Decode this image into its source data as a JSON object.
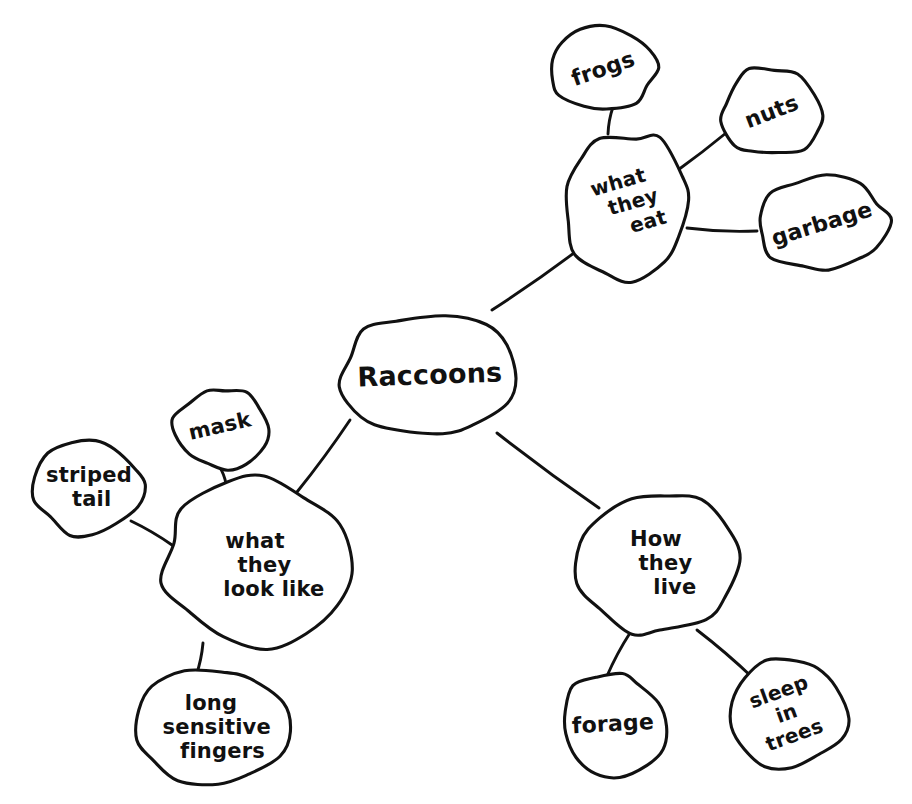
{
  "diagram": {
    "style": "hand-drawn pen on white paper",
    "ink_color": "#111111",
    "background_color": "#ffffff"
  },
  "nodes": [
    {
      "id": "raccoons",
      "label": "Raccoons",
      "lines": [
        "Raccoons"
      ],
      "role": "center",
      "cx": 430,
      "cy": 374,
      "rx": 92,
      "ry": 62,
      "font_size": 27,
      "rotate": -2,
      "text_dx": 0,
      "text_dy": 0,
      "seed": 3
    },
    {
      "id": "what-they-eat",
      "label": "what they eat",
      "lines": [
        "what",
        "they",
        "eat"
      ],
      "role": "branch",
      "cx": 625,
      "cy": 205,
      "rx": 64,
      "ry": 74,
      "font_size": 20,
      "rotate": -16,
      "text_dx": 0,
      "text_dy": 0,
      "seed": 7
    },
    {
      "id": "frogs",
      "label": "frogs",
      "lines": [
        "frogs"
      ],
      "role": "leaf",
      "cx": 603,
      "cy": 69,
      "rx": 53,
      "ry": 42,
      "font_size": 22,
      "rotate": -19,
      "text_dx": 0,
      "text_dy": 0,
      "seed": 11
    },
    {
      "id": "nuts",
      "label": "nuts",
      "lines": [
        "nuts"
      ],
      "role": "leaf",
      "cx": 772,
      "cy": 112,
      "rx": 51,
      "ry": 45,
      "font_size": 22,
      "rotate": -21,
      "text_dx": 0,
      "text_dy": 0,
      "seed": 13
    },
    {
      "id": "garbage",
      "label": "garbage",
      "lines": [
        "garbage"
      ],
      "role": "leaf",
      "cx": 822,
      "cy": 224,
      "rx": 66,
      "ry": 47,
      "font_size": 22,
      "rotate": -17,
      "text_dx": 0,
      "text_dy": 0,
      "seed": 17
    },
    {
      "id": "what-they-look-like",
      "label": "what they look like",
      "lines": [
        "what",
        "they",
        "look like"
      ],
      "role": "branch",
      "cx": 255,
      "cy": 565,
      "rx": 92,
      "ry": 84,
      "font_size": 21,
      "rotate": 0,
      "text_dx": 0,
      "text_dy": 0,
      "seed": 23
    },
    {
      "id": "mask",
      "label": "mask",
      "lines": [
        "mask"
      ],
      "role": "leaf",
      "cx": 220,
      "cy": 428,
      "rx": 46,
      "ry": 41,
      "font_size": 21,
      "rotate": -13,
      "text_dx": 0,
      "text_dy": -2,
      "seed": 29
    },
    {
      "id": "striped-tail",
      "label": "striped tail",
      "lines": [
        "striped",
        "tail"
      ],
      "role": "leaf",
      "cx": 89,
      "cy": 487,
      "rx": 56,
      "ry": 48,
      "font_size": 21,
      "rotate": 0,
      "text_dx": 0,
      "text_dy": 0,
      "seed": 31
    },
    {
      "id": "long-sensitive-fingers",
      "label": "long sensitive fingers",
      "lines": [
        "long",
        "sensitive",
        "fingers"
      ],
      "role": "leaf",
      "cx": 211,
      "cy": 727,
      "rx": 79,
      "ry": 56,
      "font_size": 21,
      "rotate": 0,
      "text_dx": 0,
      "text_dy": 0,
      "seed": 37
    },
    {
      "id": "how-they-live",
      "label": "How they live",
      "lines": [
        "How",
        "they",
        "live"
      ],
      "role": "branch",
      "cx": 656,
      "cy": 563,
      "rx": 79,
      "ry": 72,
      "font_size": 21,
      "rotate": 0,
      "text_dx": 0,
      "text_dy": 0,
      "seed": 41
    },
    {
      "id": "forage",
      "label": "forage",
      "lines": [
        "forage"
      ],
      "role": "leaf",
      "cx": 613,
      "cy": 724,
      "rx": 53,
      "ry": 51,
      "font_size": 22,
      "rotate": -3,
      "text_dx": 0,
      "text_dy": 0,
      "seed": 43
    },
    {
      "id": "sleep-in-trees",
      "label": "sleep in trees",
      "lines": [
        "sleep",
        "in",
        "trees"
      ],
      "role": "leaf",
      "cx": 787,
      "cy": 714,
      "rx": 58,
      "ry": 56,
      "font_size": 20,
      "rotate": -20,
      "text_dx": 0,
      "text_dy": 0,
      "seed": 47
    }
  ],
  "edges": [
    {
      "id": "raccoons-to-what-they-eat",
      "from": "raccoons",
      "to": "what-they-eat",
      "x1": 492,
      "y1": 310,
      "x2": 578,
      "y2": 250,
      "bow": 2
    },
    {
      "id": "what-they-eat-to-frogs",
      "from": "what-they-eat",
      "to": "frogs",
      "x1": 608,
      "y1": 134,
      "x2": 613,
      "y2": 107,
      "bow": -2
    },
    {
      "id": "what-they-eat-to-nuts",
      "from": "what-they-eat",
      "to": "nuts",
      "x1": 678,
      "y1": 170,
      "x2": 726,
      "y2": 133,
      "bow": 1
    },
    {
      "id": "what-they-eat-to-garbage",
      "from": "what-they-eat",
      "to": "garbage",
      "x1": 687,
      "y1": 228,
      "x2": 757,
      "y2": 231,
      "bow": 3
    },
    {
      "id": "raccoons-to-what-they-look-like",
      "from": "raccoons",
      "to": "what-they-look-like",
      "x1": 350,
      "y1": 420,
      "x2": 297,
      "y2": 492,
      "bow": -2
    },
    {
      "id": "what-they-look-like-to-mask",
      "from": "what-they-look-like",
      "to": "mask",
      "x1": 226,
      "y1": 484,
      "x2": 219,
      "y2": 466,
      "bow": 2
    },
    {
      "id": "what-they-look-like-to-striped-tail",
      "from": "what-they-look-like",
      "to": "striped-tail",
      "x1": 172,
      "y1": 545,
      "x2": 131,
      "y2": 521,
      "bow": 2
    },
    {
      "id": "what-they-look-like-to-long-sensitive-fingers",
      "from": "what-they-look-like",
      "to": "long-sensitive-fingers",
      "x1": 203,
      "y1": 643,
      "x2": 196,
      "y2": 676,
      "bow": -2
    },
    {
      "id": "raccoons-to-how-they-live",
      "from": "raccoons",
      "to": "how-they-live",
      "x1": 497,
      "y1": 433,
      "x2": 599,
      "y2": 508,
      "bow": 2
    },
    {
      "id": "how-they-live-to-forage",
      "from": "how-they-live",
      "to": "forage",
      "x1": 630,
      "y1": 633,
      "x2": 607,
      "y2": 676,
      "bow": 2
    },
    {
      "id": "how-they-live-to-sleep-in-trees",
      "from": "how-they-live",
      "to": "sleep-in-trees",
      "x1": 697,
      "y1": 630,
      "x2": 753,
      "y2": 678,
      "bow": -2
    }
  ]
}
